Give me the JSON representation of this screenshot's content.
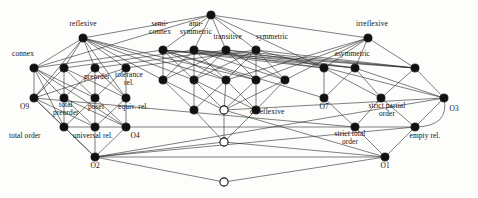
{
  "diagram": {
    "type": "hasse-lattice",
    "node_style": {
      "filled_color": "#111111",
      "hollow_fill": "#ffffff",
      "stroke": "#111111",
      "radius": 4.1
    },
    "edge_style": {
      "color": "#2a2a2a",
      "width": 0.6
    },
    "background": "#fdfdfc",
    "nodes": [
      {
        "id": "top",
        "x": 211,
        "y": 15,
        "fill": "filled",
        "label": "",
        "lx": 211,
        "ly": 6,
        "label_pos": "above"
      },
      {
        "id": "reflexive",
        "x": 83,
        "y": 38,
        "fill": "filled",
        "label": "reflexive",
        "lx": 83,
        "ly": 28,
        "label_pos": "above"
      },
      {
        "id": "irreflexive",
        "x": 368,
        "y": 38,
        "fill": "filled",
        "label": "irreflexive",
        "lx": 372,
        "ly": 28,
        "label_pos": "above"
      },
      {
        "id": "semiconnex",
        "x": 163,
        "y": 50,
        "fill": "filled",
        "label": "semi-\nconnex",
        "lx": 160,
        "ly": 35,
        "label_pos": "above"
      },
      {
        "id": "antisymmetric",
        "x": 194,
        "y": 50,
        "fill": "filled",
        "label": "anti-\nsymmetric",
        "lx": 196,
        "ly": 35,
        "label_pos": "above"
      },
      {
        "id": "transitive",
        "x": 226,
        "y": 50,
        "fill": "filled",
        "label": "transitive",
        "lx": 228,
        "ly": 41,
        "label_pos": "above"
      },
      {
        "id": "symmetric",
        "x": 256,
        "y": 50,
        "fill": "filled",
        "label": "symmetric",
        "lx": 272,
        "ly": 41,
        "label_pos": "above"
      },
      {
        "id": "connex",
        "x": 34,
        "y": 68,
        "fill": "filled",
        "label": "connex",
        "lx": 30,
        "ly": 58,
        "label_pos": "above-left"
      },
      {
        "id": "r2b",
        "x": 64,
        "y": 68,
        "fill": "filled",
        "label": "",
        "lx": 64,
        "ly": 60,
        "label_pos": "above"
      },
      {
        "id": "preorder",
        "x": 95,
        "y": 68,
        "fill": "filled",
        "label": "preorder",
        "lx": 97,
        "ly": 73,
        "label_pos": "below"
      },
      {
        "id": "tolerance",
        "x": 126,
        "y": 68,
        "fill": "filled",
        "label": "tolerance\nrel.",
        "lx": 129,
        "ly": 71,
        "label_pos": "below"
      },
      {
        "id": "r2c1",
        "x": 163,
        "y": 80,
        "fill": "filled",
        "label": "",
        "lx": 163,
        "ly": 72,
        "label_pos": "above"
      },
      {
        "id": "r2c2",
        "x": 194,
        "y": 80,
        "fill": "filled",
        "label": "",
        "lx": 194,
        "ly": 72,
        "label_pos": "above"
      },
      {
        "id": "r2c3",
        "x": 226,
        "y": 80,
        "fill": "filled",
        "label": "",
        "lx": 226,
        "ly": 72,
        "label_pos": "above"
      },
      {
        "id": "r2c4",
        "x": 256,
        "y": 80,
        "fill": "filled",
        "label": "",
        "lx": 256,
        "ly": 72,
        "label_pos": "above"
      },
      {
        "id": "r2c5",
        "x": 285,
        "y": 80,
        "fill": "filled",
        "label": "",
        "lx": 285,
        "ly": 72,
        "label_pos": "above"
      },
      {
        "id": "asymmetric",
        "x": 324,
        "y": 68,
        "fill": "filled",
        "label": "asymmetric",
        "lx": 352,
        "ly": 58,
        "label_pos": "above-right"
      },
      {
        "id": "r2r2",
        "x": 355,
        "y": 68,
        "fill": "filled",
        "label": "",
        "lx": 355,
        "ly": 60,
        "label_pos": "above"
      },
      {
        "id": "r2r3",
        "x": 415,
        "y": 68,
        "fill": "filled",
        "label": "",
        "lx": 415,
        "ly": 60,
        "label_pos": "above"
      },
      {
        "id": "O9",
        "x": 34,
        "y": 98,
        "fill": "filled",
        "label": "O9",
        "lx": 25,
        "ly": 103,
        "label_pos": "below-left"
      },
      {
        "id": "totalpreorder",
        "x": 64,
        "y": 98,
        "fill": "filled",
        "label": "total\npreorder",
        "lx": 66,
        "ly": 101,
        "label_pos": "below"
      },
      {
        "id": "poset",
        "x": 95,
        "y": 98,
        "fill": "filled",
        "label": "poset",
        "lx": 96,
        "ly": 103,
        "label_pos": "below"
      },
      {
        "id": "equivrel",
        "x": 126,
        "y": 98,
        "fill": "filled",
        "label": "equiv. rel.",
        "lx": 133,
        "ly": 103,
        "label_pos": "below"
      },
      {
        "id": "m3a",
        "x": 194,
        "y": 110,
        "fill": "filled",
        "label": "",
        "lx": 194,
        "ly": 102,
        "label_pos": "above"
      },
      {
        "id": "coreflexive",
        "x": 224,
        "y": 110,
        "fill": "hollow",
        "label": "coreflexive",
        "lx": 250,
        "ly": 112,
        "label_pos": "right"
      },
      {
        "id": "m3c",
        "x": 256,
        "y": 110,
        "fill": "filled",
        "label": "",
        "lx": 256,
        "ly": 102,
        "label_pos": "above"
      },
      {
        "id": "O7",
        "x": 324,
        "y": 98,
        "fill": "filled",
        "label": "O7",
        "lx": 324,
        "ly": 103,
        "label_pos": "below"
      },
      {
        "id": "strictpartial",
        "x": 381,
        "y": 98,
        "fill": "filled",
        "label": "strict partial\norder",
        "lx": 387,
        "ly": 102,
        "label_pos": "below"
      },
      {
        "id": "O3",
        "x": 444,
        "y": 98,
        "fill": "filled",
        "label": "O3",
        "lx": 450,
        "ly": 105,
        "label_pos": "below-right"
      },
      {
        "id": "totalorder",
        "x": 64,
        "y": 127,
        "fill": "filled",
        "label": "total order",
        "lx": 37,
        "ly": 132,
        "label_pos": "below-left"
      },
      {
        "id": "universalrel",
        "x": 95,
        "y": 127,
        "fill": "filled",
        "label": "universal rel.",
        "lx": 93,
        "ly": 132,
        "label_pos": "below"
      },
      {
        "id": "O4",
        "x": 126,
        "y": 127,
        "fill": "filled",
        "label": "O4",
        "lx": 131,
        "ly": 132,
        "label_pos": "below-right"
      },
      {
        "id": "hollow2",
        "x": 224,
        "y": 142,
        "fill": "hollow",
        "label": "",
        "lx": 224,
        "ly": 146,
        "label_pos": "below"
      },
      {
        "id": "stricttotal",
        "x": 355,
        "y": 127,
        "fill": "filled",
        "label": "strict total\norder",
        "lx": 350,
        "ly": 130,
        "label_pos": "below"
      },
      {
        "id": "emptyrel",
        "x": 415,
        "y": 127,
        "fill": "filled",
        "label": "empty rel.",
        "lx": 421,
        "ly": 132,
        "label_pos": "below-right"
      },
      {
        "id": "O2",
        "x": 95,
        "y": 157,
        "fill": "filled",
        "label": "O2",
        "lx": 95,
        "ly": 162,
        "label_pos": "below"
      },
      {
        "id": "O1",
        "x": 385,
        "y": 157,
        "fill": "filled",
        "label": "O1",
        "lx": 385,
        "ly": 162,
        "label_pos": "below"
      },
      {
        "id": "bottom",
        "x": 224,
        "y": 182,
        "fill": "hollow",
        "label": "",
        "lx": 224,
        "ly": 188,
        "label_pos": "below"
      }
    ],
    "edges": [
      [
        "top",
        "reflexive"
      ],
      [
        "top",
        "irreflexive"
      ],
      [
        "top",
        "semiconnex"
      ],
      [
        "top",
        "antisymmetric"
      ],
      [
        "top",
        "transitive"
      ],
      [
        "top",
        "symmetric"
      ],
      [
        "reflexive",
        "connex"
      ],
      [
        "reflexive",
        "r2b"
      ],
      [
        "reflexive",
        "preorder"
      ],
      [
        "reflexive",
        "tolerance"
      ],
      [
        "reflexive",
        "r2c1"
      ],
      [
        "reflexive",
        "r2c2"
      ],
      [
        "reflexive",
        "r2c3"
      ],
      [
        "reflexive",
        "r2c4"
      ],
      [
        "irreflexive",
        "asymmetric"
      ],
      [
        "irreflexive",
        "r2r2"
      ],
      [
        "irreflexive",
        "r2r3"
      ],
      [
        "irreflexive",
        "r2c5"
      ],
      [
        "irreflexive",
        "r2c4"
      ],
      [
        "irreflexive",
        "r2c3"
      ],
      [
        "semiconnex",
        "connex"
      ],
      [
        "semiconnex",
        "r2c1"
      ],
      [
        "semiconnex",
        "r2c2"
      ],
      [
        "semiconnex",
        "r2c3"
      ],
      [
        "semiconnex",
        "r2c4"
      ],
      [
        "semiconnex",
        "asymmetric"
      ],
      [
        "semiconnex",
        "r2r2"
      ],
      [
        "semiconnex",
        "r2r3"
      ],
      [
        "antisymmetric",
        "r2b"
      ],
      [
        "antisymmetric",
        "r2c1"
      ],
      [
        "antisymmetric",
        "r2c2"
      ],
      [
        "antisymmetric",
        "r2c3"
      ],
      [
        "antisymmetric",
        "r2c5"
      ],
      [
        "antisymmetric",
        "asymmetric"
      ],
      [
        "antisymmetric",
        "r2r2"
      ],
      [
        "antisymmetric",
        "r2r3"
      ],
      [
        "transitive",
        "preorder"
      ],
      [
        "transitive",
        "r2c1"
      ],
      [
        "transitive",
        "r2c2"
      ],
      [
        "transitive",
        "r2c4"
      ],
      [
        "transitive",
        "r2c5"
      ],
      [
        "transitive",
        "r2r2"
      ],
      [
        "transitive",
        "r2r3"
      ],
      [
        "symmetric",
        "tolerance"
      ],
      [
        "symmetric",
        "r2c2"
      ],
      [
        "symmetric",
        "r2c3"
      ],
      [
        "symmetric",
        "r2c4"
      ],
      [
        "symmetric",
        "r2c5"
      ],
      [
        "symmetric",
        "r2r3"
      ],
      [
        "connex",
        "O9"
      ],
      [
        "connex",
        "totalpreorder"
      ],
      [
        "connex",
        "poset"
      ],
      [
        "r2b",
        "O9"
      ],
      [
        "r2b",
        "totalpreorder"
      ],
      [
        "r2b",
        "poset"
      ],
      [
        "r2b",
        "equivrel"
      ],
      [
        "preorder",
        "totalpreorder"
      ],
      [
        "preorder",
        "poset"
      ],
      [
        "preorder",
        "equivrel"
      ],
      [
        "tolerance",
        "poset"
      ],
      [
        "tolerance",
        "equivrel"
      ],
      [
        "tolerance",
        "O9"
      ],
      [
        "r2c1",
        "m3a"
      ],
      [
        "r2c1",
        "coreflexive"
      ],
      [
        "r2c2",
        "m3a"
      ],
      [
        "r2c2",
        "coreflexive"
      ],
      [
        "r2c2",
        "m3c"
      ],
      [
        "r2c3",
        "m3a"
      ],
      [
        "r2c3",
        "coreflexive"
      ],
      [
        "r2c3",
        "m3c"
      ],
      [
        "r2c4",
        "coreflexive"
      ],
      [
        "r2c4",
        "m3c"
      ],
      [
        "r2c5",
        "coreflexive"
      ],
      [
        "r2c5",
        "m3c"
      ],
      [
        "asymmetric",
        "O7"
      ],
      [
        "asymmetric",
        "strictpartial"
      ],
      [
        "r2r2",
        "O7"
      ],
      [
        "r2r2",
        "strictpartial"
      ],
      [
        "r2r2",
        "O3"
      ],
      [
        "r2r3",
        "strictpartial"
      ],
      [
        "r2r3",
        "O3"
      ],
      [
        "O9",
        "totalorder"
      ],
      [
        "O9",
        "universalrel"
      ],
      [
        "totalpreorder",
        "totalorder"
      ],
      [
        "totalpreorder",
        "universalrel"
      ],
      [
        "totalpreorder",
        "O4"
      ],
      [
        "poset",
        "totalorder"
      ],
      [
        "poset",
        "universalrel"
      ],
      [
        "poset",
        "O4"
      ],
      [
        "equivrel",
        "universalrel"
      ],
      [
        "equivrel",
        "O4"
      ],
      [
        "m3a",
        "hollow2"
      ],
      [
        "coreflexive",
        "hollow2"
      ],
      [
        "m3c",
        "hollow2"
      ],
      [
        "O7",
        "stricttotal"
      ],
      [
        "strictpartial",
        "stricttotal"
      ],
      [
        "strictpartial",
        "emptyrel"
      ],
      [
        "O3",
        "emptyrel"
      ],
      [
        "totalorder",
        "O2"
      ],
      [
        "universalrel",
        "O2"
      ],
      [
        "O4",
        "O2"
      ],
      [
        "stricttotal",
        "O1"
      ],
      [
        "emptyrel",
        "O1"
      ],
      [
        "O2",
        "bottom"
      ],
      [
        "O1",
        "bottom"
      ],
      [
        "O2",
        "O1"
      ],
      [
        "hollow2",
        "O2"
      ],
      [
        "hollow2",
        "O1"
      ]
    ],
    "long_edges": [
      [
        "top",
        "connex"
      ],
      [
        "top",
        "asymmetric"
      ],
      [
        "reflexive",
        "O9"
      ],
      [
        "reflexive",
        "equivrel"
      ],
      [
        "connex",
        "totalorder"
      ],
      [
        "connex",
        "O4"
      ],
      [
        "O9",
        "O2"
      ],
      [
        "O2",
        "emptyrel"
      ],
      [
        "O2",
        "O3"
      ],
      [
        "semiconnex",
        "O7"
      ],
      [
        "symmetric",
        "O3"
      ],
      [
        "coreflexive",
        "O3"
      ],
      [
        "coreflexive",
        "O1"
      ],
      [
        "O9",
        "stricttotal"
      ],
      [
        "totalorder",
        "emptyrel"
      ]
    ]
  }
}
